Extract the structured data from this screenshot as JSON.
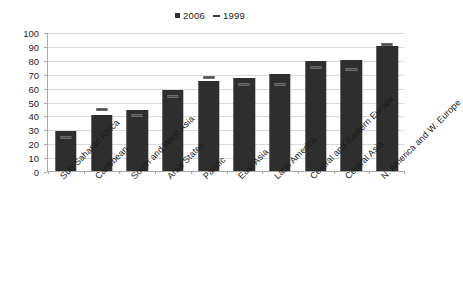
{
  "chart_data": {
    "type": "bar",
    "title": "",
    "xlabel": "",
    "ylabel": "",
    "ylim": [
      0,
      100
    ],
    "yticks": [
      0,
      10,
      20,
      30,
      40,
      50,
      60,
      70,
      80,
      90,
      100
    ],
    "grid": true,
    "legend_position": "top-center",
    "categories": [
      "Sub-Saharan Africa",
      "Caribbean",
      "South and West Asia",
      "Arab States",
      "Pacific",
      "East Asia",
      "Latin America",
      "Central and Eastern Europe",
      "Central Asia",
      "N. America and W. Europe"
    ],
    "series": [
      {
        "name": "2006",
        "type": "bar",
        "color": "#2e2e2e",
        "values": [
          29,
          40,
          44,
          58,
          65,
          67,
          70,
          79,
          80,
          90
        ]
      },
      {
        "name": "1999",
        "type": "marker",
        "color": "#4a4a4a",
        "values": [
          25,
          45,
          41,
          54,
          68,
          63,
          63,
          75,
          74,
          92
        ]
      }
    ]
  },
  "legend": {
    "entries": [
      {
        "label": "2006",
        "marker": "square-marker",
        "color": "#2e2e2e"
      },
      {
        "label": "1999",
        "marker": "dash-marker",
        "color": "#3a3a3a"
      }
    ]
  },
  "axis": {
    "y_tick_labels": [
      "100",
      "90",
      "80",
      "70",
      "60",
      "50",
      "40",
      "30",
      "20",
      "10",
      "0"
    ]
  }
}
